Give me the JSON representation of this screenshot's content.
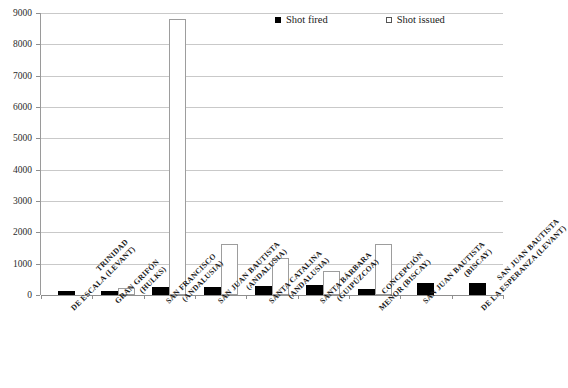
{
  "chart_data": {
    "type": "bar",
    "title": "",
    "subtitle": "",
    "xlabel": "",
    "ylabel": "",
    "ylim": [
      0,
      9000
    ],
    "ytick_step": 1000,
    "yticks": [
      "0",
      "1000",
      "2000",
      "3000",
      "4000",
      "5000",
      "6000",
      "7000",
      "8000",
      "9000"
    ],
    "grid": true,
    "legend_position": "top-right",
    "categories": [
      "TRINIDAD DE ESCALA (Levant)",
      "GRAN GRIFÓN (Hulks)",
      "SAN FRANCISCO (Andalusia)",
      "SAN JUAN BAUTISTA (Andalusia)",
      "SANTA CATALINA (Andalusia)",
      "SANTA BÁRBARA (Guipúzcoa)",
      "CONCEPCIÓN MENOR (Biscay)",
      "SAN JUAN BAUTISTA (Biscay)",
      "SAN JUAN BAUTISTA DE LA ESPERANZA (Levant)"
    ],
    "category_lines": [
      [
        "TRINIDAD",
        "DE ESCALA (Levant)"
      ],
      [
        "GRAN GRIFÓN",
        "(Hulks)"
      ],
      [
        "SAN FRANCISCO",
        "(Andalusia)"
      ],
      [
        "SAN JUAN BAUTISTA",
        "(Andalusia)"
      ],
      [
        "SANTA CATALINA",
        "(Andalusia)"
      ],
      [
        "SANTA BÁRBARA",
        "(Guipúzcoa)"
      ],
      [
        "CONCEPCIÓN",
        "MENOR (Biscay)"
      ],
      [
        "SAN JUAN BAUTISTA",
        "(Biscay)"
      ],
      [
        "SAN JUAN BAUTISTA",
        "DE LA ESPERANZA (Levant)"
      ]
    ],
    "series": [
      {
        "name": "Shot fired",
        "color": "#000000",
        "values": [
          120,
          130,
          250,
          250,
          280,
          320,
          180,
          380,
          370
        ]
      },
      {
        "name": "Shot issued",
        "color": "#ffffff",
        "values": [
          0,
          230,
          8800,
          1620,
          1180,
          780,
          1620,
          0,
          0
        ]
      }
    ]
  },
  "legend": {
    "items": [
      {
        "label": "Shot fired",
        "marker": "filled-square"
      },
      {
        "label": "Shot issued",
        "marker": "open-square"
      }
    ]
  },
  "colors": {
    "fired": "#000000",
    "issued": "#ffffff",
    "grid": "#c9c9c9",
    "axis": "#8e8e8e",
    "text": "#1a1a1a",
    "background": "#ffffff"
  }
}
